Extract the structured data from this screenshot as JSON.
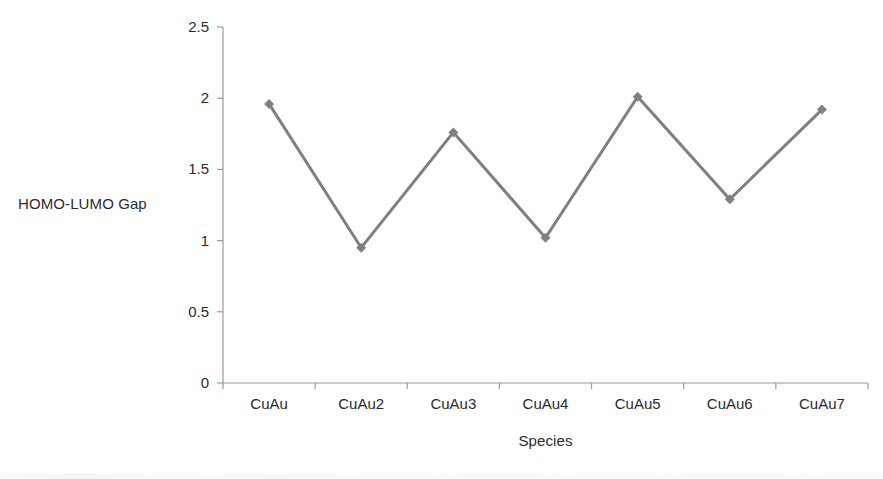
{
  "chart_data": {
    "type": "line",
    "title": "",
    "xlabel": "Species",
    "ylabel": "HOMO-LUMO Gap",
    "categories": [
      "CuAu",
      "CuAu2",
      "CuAu3",
      "CuAu4",
      "CuAu5",
      "CuAu6",
      "CuAu7"
    ],
    "values": [
      1.96,
      0.95,
      1.76,
      1.02,
      2.01,
      1.29,
      1.92
    ],
    "series": [
      {
        "name": "HOMO-LUMO Gap",
        "values": [
          1.96,
          0.95,
          1.76,
          1.02,
          2.01,
          1.29,
          1.92
        ],
        "color": "#808080",
        "marker": "diamond"
      }
    ],
    "ylim": [
      0,
      2.5
    ],
    "y_ticks": [
      0,
      0.5,
      1,
      1.5,
      2,
      2.5
    ],
    "y_tick_labels": [
      "0",
      "0.5",
      "1",
      "1.5",
      "2",
      "2.5"
    ],
    "grid": false,
    "legend": false,
    "legend_position": "none",
    "background": "#ffffff",
    "axis_color": "#9a9a9a"
  },
  "axes": {
    "y_title": "HOMO-LUMO Gap",
    "x_title": "Species"
  }
}
